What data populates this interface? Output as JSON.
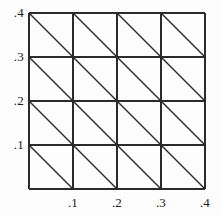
{
  "figure": {
    "title": "",
    "background_color": "#fdfdfd",
    "line_color": "#2b2b2b",
    "text_color": "#1a1a1a"
  },
  "chart_data": {
    "type": "diagram",
    "subtype": "triangular-mesh",
    "title": "",
    "xlabel": "",
    "ylabel": "",
    "xlim": [
      0.0,
      0.4
    ],
    "ylim": [
      0.0,
      0.4
    ],
    "grid": true,
    "legend": null,
    "nx_cells": 4,
    "ny_cells": 4,
    "cell_size": 0.1,
    "diagonal_direction": "top-left-to-bottom-right",
    "triangles_total": 32,
    "x_tick_values": [
      0.1,
      0.2,
      0.3,
      0.4
    ],
    "x_tick_labels": [
      ".1",
      ".2",
      ".3",
      ".4"
    ],
    "y_tick_values": [
      0.1,
      0.2,
      0.3,
      0.4
    ],
    "y_tick_labels": [
      ".1",
      ".2",
      ".3",
      ".4"
    ],
    "grid_x_lines": [
      0.0,
      0.1,
      0.2,
      0.3,
      0.4
    ],
    "grid_y_lines": [
      0.0,
      0.1,
      0.2,
      0.3,
      0.4
    ],
    "node_count": 25,
    "nodes": [
      [
        0.0,
        0.0
      ],
      [
        0.1,
        0.0
      ],
      [
        0.2,
        0.0
      ],
      [
        0.3,
        0.0
      ],
      [
        0.4,
        0.0
      ],
      [
        0.0,
        0.1
      ],
      [
        0.1,
        0.1
      ],
      [
        0.2,
        0.1
      ],
      [
        0.3,
        0.1
      ],
      [
        0.4,
        0.1
      ],
      [
        0.0,
        0.2
      ],
      [
        0.1,
        0.2
      ],
      [
        0.2,
        0.2
      ],
      [
        0.3,
        0.2
      ],
      [
        0.4,
        0.2
      ],
      [
        0.0,
        0.3
      ],
      [
        0.1,
        0.3
      ],
      [
        0.2,
        0.3
      ],
      [
        0.3,
        0.3
      ],
      [
        0.4,
        0.3
      ],
      [
        0.0,
        0.4
      ],
      [
        0.1,
        0.4
      ],
      [
        0.2,
        0.4
      ],
      [
        0.3,
        0.4
      ],
      [
        0.4,
        0.4
      ]
    ]
  },
  "axes": {
    "y_ticks": [
      {
        "label": ".4",
        "value": 0.4
      },
      {
        "label": ".3",
        "value": 0.3
      },
      {
        "label": ".2",
        "value": 0.2
      },
      {
        "label": ".1",
        "value": 0.1
      }
    ],
    "x_ticks": [
      {
        "label": ".1",
        "value": 0.1
      },
      {
        "label": ".2",
        "value": 0.2
      },
      {
        "label": ".3",
        "value": 0.3
      },
      {
        "label": ".4",
        "value": 0.4
      }
    ]
  }
}
